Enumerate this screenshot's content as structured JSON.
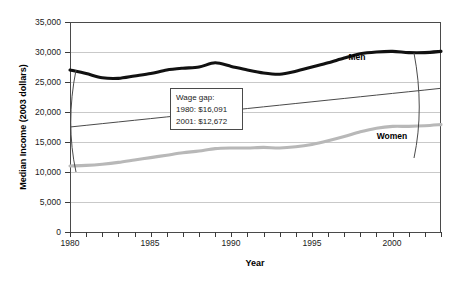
{
  "chart_data": {
    "type": "line",
    "title": "",
    "xlabel": "Year",
    "ylabel": "Median Income (2003 dollars)",
    "xlim": [
      1980,
      2003
    ],
    "ylim": [
      0,
      35000
    ],
    "grid": true,
    "legend_position": "inline-labels",
    "y_ticks": [
      0,
      5000,
      10000,
      15000,
      20000,
      25000,
      30000,
      35000
    ],
    "y_tick_labels": [
      "0",
      "5,000",
      "10,000",
      "15,000",
      "20,000",
      "25,000",
      "30,000",
      "35,000"
    ],
    "x_ticks": [
      1980,
      1981,
      1982,
      1983,
      1984,
      1985,
      1986,
      1987,
      1988,
      1989,
      1990,
      1991,
      1992,
      1993,
      1994,
      1995,
      1996,
      1997,
      1998,
      1999,
      2000,
      2001,
      2002,
      2003
    ],
    "x_tick_labels_shown": [
      "1980",
      "1985",
      "1990",
      "1995",
      "2000"
    ],
    "x_labeled_years": [
      1980,
      1985,
      1990,
      1995,
      2000
    ],
    "x": [
      1980,
      1981,
      1982,
      1983,
      1984,
      1985,
      1986,
      1987,
      1988,
      1989,
      1990,
      1991,
      1992,
      1993,
      1994,
      1995,
      1996,
      1997,
      1998,
      1999,
      2000,
      2001,
      2002,
      2003
    ],
    "series": [
      {
        "name": "Men",
        "label": "Men",
        "color": "#111111",
        "style": "thick-solid",
        "values": [
          27000,
          26400,
          25700,
          25600,
          26000,
          26400,
          27000,
          27300,
          27500,
          28200,
          27600,
          27000,
          26500,
          26300,
          26800,
          27500,
          28200,
          29000,
          29700,
          30000,
          30100,
          29900,
          29900,
          30100
        ]
      },
      {
        "name": "Women",
        "label": "Women",
        "color": "#b8b8b8",
        "style": "thick-solid",
        "values": [
          11000,
          11100,
          11300,
          11600,
          12000,
          12400,
          12800,
          13200,
          13500,
          13900,
          14000,
          14000,
          14100,
          14000,
          14200,
          14600,
          15200,
          15900,
          16700,
          17300,
          17600,
          17600,
          17700,
          17900
        ]
      },
      {
        "name": "Trend",
        "label": "",
        "color": "#4a4a4a",
        "style": "thin-solid",
        "values": [
          17500,
          17780,
          18060,
          18340,
          18620,
          18900,
          19180,
          19460,
          19740,
          20020,
          20300,
          20580,
          20860,
          21140,
          21420,
          21700,
          21980,
          22260,
          22540,
          22820,
          23100,
          23380,
          23660,
          23950
        ]
      }
    ],
    "annotations": [
      {
        "name": "wage-gap-note",
        "lines": [
          "Wage gap:",
          "1980: $16,091",
          "2001: $12,672"
        ],
        "title_line": "Wage gap:",
        "value_1980": "1980: $16,091",
        "value_2001": "2001: $12,672"
      }
    ],
    "brackets": [
      {
        "name": "gap-bracket-left",
        "year": 1980,
        "from": 27000,
        "to": 11000
      },
      {
        "name": "gap-bracket-right",
        "year": 2003,
        "from": 30100,
        "to": 17900
      }
    ]
  }
}
